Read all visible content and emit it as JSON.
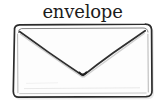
{
  "canvas": {
    "width": 165,
    "height": 109,
    "background_color": "#ffffff"
  },
  "label": {
    "text": "envelope",
    "color": "#1c1c1c"
  },
  "drawing": {
    "subject": "envelope",
    "style": "hand-drawn pencil sketch",
    "stroke_color": "#2b2b2b",
    "fill_color": "#fdfdfd",
    "shadow_color": "#c9c9c9",
    "body": {
      "left": 13,
      "top": 24,
      "right": 152,
      "bottom": 97,
      "corner_radius": 6
    },
    "flap": {
      "left_corner_x": 20,
      "left_corner_y": 32,
      "right_corner_x": 145,
      "right_corner_y": 31,
      "point_x": 83,
      "point_y": 75
    }
  }
}
